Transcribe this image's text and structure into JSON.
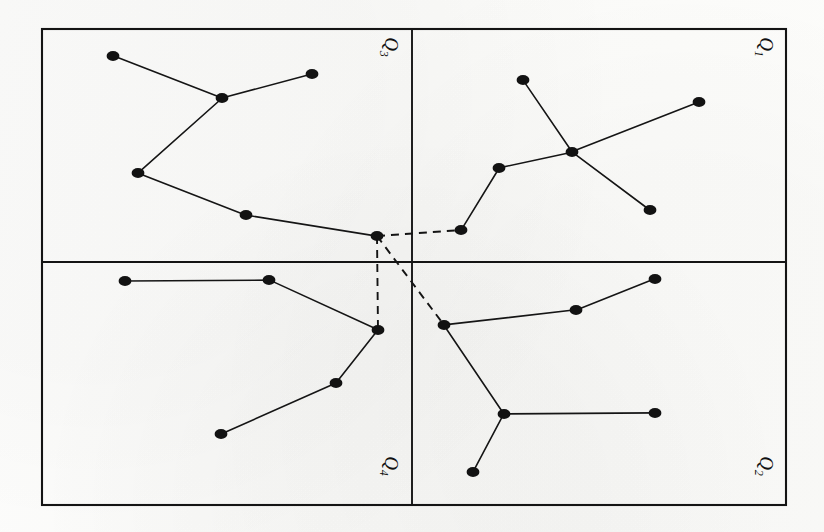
{
  "figure": {
    "type": "diagram",
    "background_color": "#fdfdfc",
    "ink_color": "#141414",
    "frame": {
      "x": 42,
      "y": 29,
      "width": 744,
      "height": 476,
      "stroke_width": 2.1
    },
    "dividers": {
      "vertical_x": 412,
      "horizontal_y": 262,
      "stroke_width": 1.9
    },
    "node": {
      "radius_x": 6.4,
      "radius_y": 5.0,
      "fill": "#121212"
    },
    "edge": {
      "stroke_width": 1.6,
      "color": "#151515"
    },
    "dashed_edge": {
      "stroke_width": 1.9,
      "color": "#141414",
      "dash_pattern": "8,6"
    }
  },
  "quadrants": [
    {
      "id": "q3",
      "label": "Q",
      "subscript": "3",
      "position": "top-left",
      "label_x": 389,
      "label_y": 47,
      "label_rotation": 90,
      "nodes": [
        {
          "id": "q3-n1",
          "x": 113,
          "y": 56
        },
        {
          "id": "q3-n2",
          "x": 222,
          "y": 98
        },
        {
          "id": "q3-n3",
          "x": 312,
          "y": 74
        },
        {
          "id": "q3-n4",
          "x": 138,
          "y": 173
        },
        {
          "id": "q3-n5",
          "x": 246,
          "y": 215
        },
        {
          "id": "q3-hub",
          "x": 377,
          "y": 236
        }
      ],
      "edges": [
        [
          "q3-n1",
          "q3-n2"
        ],
        [
          "q3-n2",
          "q3-n3"
        ],
        [
          "q3-n2",
          "q3-n4"
        ],
        [
          "q3-n4",
          "q3-n5"
        ],
        [
          "q3-n5",
          "q3-hub"
        ]
      ]
    },
    {
      "id": "q1",
      "label": "Q",
      "subscript": "1",
      "position": "top-right",
      "label_x": 764,
      "label_y": 47,
      "label_rotation": 90,
      "nodes": [
        {
          "id": "q1-n1",
          "x": 523,
          "y": 80
        },
        {
          "id": "q1-n2",
          "x": 699,
          "y": 102
        },
        {
          "id": "q1-n3",
          "x": 572,
          "y": 152
        },
        {
          "id": "q1-n4",
          "x": 499,
          "y": 168
        },
        {
          "id": "q1-n5",
          "x": 650,
          "y": 210
        },
        {
          "id": "q1-link",
          "x": 461,
          "y": 230
        }
      ],
      "edges": [
        [
          "q1-n1",
          "q1-n3"
        ],
        [
          "q1-n2",
          "q1-n3"
        ],
        [
          "q1-n3",
          "q1-n4"
        ],
        [
          "q1-n3",
          "q1-n5"
        ],
        [
          "q1-n4",
          "q1-link"
        ]
      ]
    },
    {
      "id": "q4",
      "label": "Q",
      "subscript": "4",
      "position": "bottom-left",
      "label_x": 389,
      "label_y": 466,
      "label_rotation": 90,
      "nodes": [
        {
          "id": "q4-n1",
          "x": 125,
          "y": 281
        },
        {
          "id": "q4-n2",
          "x": 269,
          "y": 280
        },
        {
          "id": "q4-link",
          "x": 378,
          "y": 330
        },
        {
          "id": "q4-n4",
          "x": 336,
          "y": 383
        },
        {
          "id": "q4-n5",
          "x": 221,
          "y": 434
        }
      ],
      "edges": [
        [
          "q4-n1",
          "q4-n2"
        ],
        [
          "q4-n2",
          "q4-link"
        ],
        [
          "q4-link",
          "q4-n4"
        ],
        [
          "q4-n4",
          "q4-n5"
        ]
      ]
    },
    {
      "id": "q2",
      "label": "Q",
      "subscript": "2",
      "position": "bottom-right",
      "label_x": 764,
      "label_y": 466,
      "label_rotation": 90,
      "nodes": [
        {
          "id": "q2-link",
          "x": 444,
          "y": 325
        },
        {
          "id": "q2-n2",
          "x": 576,
          "y": 310
        },
        {
          "id": "q2-n3",
          "x": 655,
          "y": 279
        },
        {
          "id": "q2-n4",
          "x": 504,
          "y": 414
        },
        {
          "id": "q2-n5",
          "x": 655,
          "y": 413
        },
        {
          "id": "q2-n6",
          "x": 473,
          "y": 472
        }
      ],
      "edges": [
        [
          "q2-link",
          "q2-n2"
        ],
        [
          "q2-n2",
          "q2-n3"
        ],
        [
          "q2-link",
          "q2-n4"
        ],
        [
          "q2-n4",
          "q2-n5"
        ],
        [
          "q2-n4",
          "q2-n6"
        ]
      ]
    }
  ],
  "cross_quadrant_edges": [
    {
      "from": "q3-hub",
      "to": "q1-link",
      "style": "dashed"
    },
    {
      "from": "q3-hub",
      "to": "q4-link",
      "style": "dashed"
    },
    {
      "from": "q3-hub",
      "to": "q2-link",
      "style": "dashed"
    }
  ]
}
